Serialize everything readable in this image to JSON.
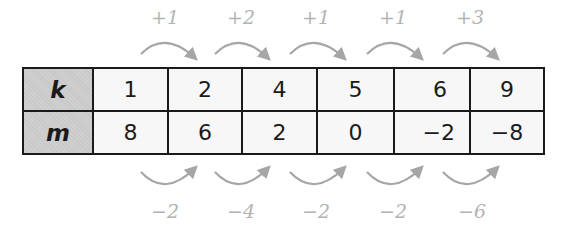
{
  "table": {
    "rows": [
      {
        "header": "k",
        "values": [
          "1",
          "2",
          "4",
          "5",
          "6",
          "9"
        ]
      },
      {
        "header": "m",
        "values": [
          "8",
          "6",
          "2",
          "0",
          "−2",
          "−8"
        ]
      }
    ]
  },
  "top_differences": [
    "+1",
    "+2",
    "+1",
    "+1",
    "+3"
  ],
  "bottom_differences": [
    "−2",
    "−4",
    "−2",
    "−2",
    "−6"
  ],
  "colors": {
    "border": "#1a1a1a",
    "header_fill": "#cfcfcf",
    "cell_fill": "#f7f7f7",
    "arrow": "#a6a6a6",
    "label": "#b3b3b3"
  }
}
